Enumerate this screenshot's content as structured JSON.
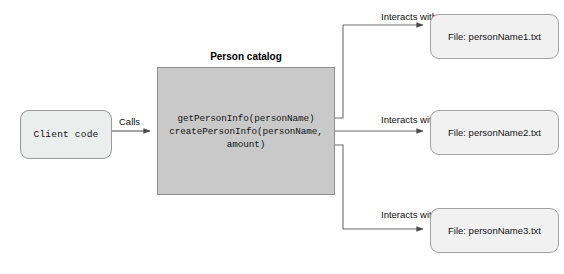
{
  "diagram": {
    "colors": {
      "canvas_background": "#ffffff",
      "client_box_fill": "#eceded",
      "catalog_box_fill": "#c9c9c9",
      "file_box_fill": "#f1f1f1",
      "stroke": "#6e6e6e",
      "text": "#111111"
    },
    "nodes": {
      "client_code": {
        "label": "Client code",
        "shape": "rounded-rectangle"
      },
      "person_catalog": {
        "title": "Person catalog",
        "shape": "rectangle",
        "code_lines": [
          "getPersonInfo(personName)",
          "createPersonInfo(personName,",
          "amount)"
        ]
      },
      "files": [
        {
          "label": "File: personName1.txt",
          "shape": "rounded-rectangle"
        },
        {
          "label": "File: personName2.txt",
          "shape": "rounded-rectangle"
        },
        {
          "label": "File: personName3.txt",
          "shape": "rounded-rectangle"
        }
      ]
    },
    "edges": {
      "calls": {
        "label": "Calls",
        "from": "client_code",
        "to": "person_catalog"
      },
      "interacts": [
        {
          "label": "Interacts with",
          "from": "person_catalog",
          "to": "file_1"
        },
        {
          "label": "Interacts with",
          "from": "person_catalog",
          "to": "file_2"
        },
        {
          "label": "Interacts with",
          "from": "person_catalog",
          "to": "file_3"
        }
      ]
    }
  }
}
